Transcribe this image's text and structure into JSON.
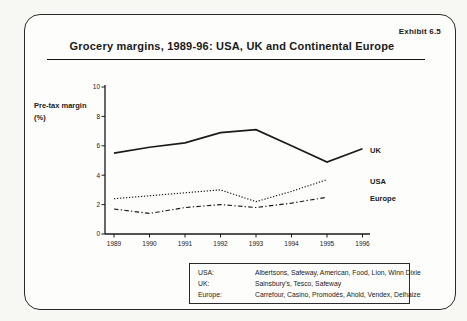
{
  "exhibit_label": "Exhibit 6.5",
  "title": "Grocery margins, 1989-96: USA, UK and Continental Europe",
  "chart_data": {
    "type": "line",
    "title": "Grocery margins, 1989-96: USA, UK and Continental Europe",
    "ylabel_line1": "Pre-tax margin",
    "ylabel_line2": "(%)",
    "xlabel": "",
    "x_ticks": [
      1989,
      1990,
      1991,
      1992,
      1993,
      1994,
      1995,
      1996
    ],
    "ylim": [
      0,
      10
    ],
    "y_ticks": [
      0,
      2,
      4,
      6,
      8,
      10
    ],
    "grid": false,
    "legend_position": "labels-at-line-ends-right",
    "series": [
      {
        "name": "UK",
        "pattern": "solid",
        "x": [
          1989,
          1990,
          1991,
          1992,
          1993,
          1994,
          1995,
          1996
        ],
        "values": [
          5.5,
          5.9,
          6.2,
          6.9,
          7.1,
          6.0,
          4.9,
          5.8
        ]
      },
      {
        "name": "USA",
        "pattern": "dotted",
        "x": [
          1989,
          1990,
          1991,
          1992,
          1993,
          1994,
          1995
        ],
        "values": [
          2.4,
          2.6,
          2.8,
          3.0,
          2.2,
          2.9,
          3.7
        ]
      },
      {
        "name": "Europe",
        "pattern": "dashdot",
        "x": [
          1989,
          1990,
          1991,
          1992,
          1993,
          1994,
          1995
        ],
        "values": [
          1.7,
          1.4,
          1.8,
          2.0,
          1.8,
          2.1,
          2.5
        ]
      }
    ]
  },
  "footnote": {
    "rows": [
      {
        "label": "USA:",
        "text": "Albertsons, Safeway, American, Food, Lion, Winn Dixie"
      },
      {
        "label": "UK:",
        "text": "Sainsbury's, Tesco, Safeway"
      },
      {
        "label": "Europe:",
        "text": "Carrefour, Casino, Promodès, Ahold, Vendex, Delhaize"
      }
    ]
  },
  "colors": {
    "ink": "#1a1a1a",
    "paper": "#f7f7f3",
    "card": "#fdfdfb"
  }
}
